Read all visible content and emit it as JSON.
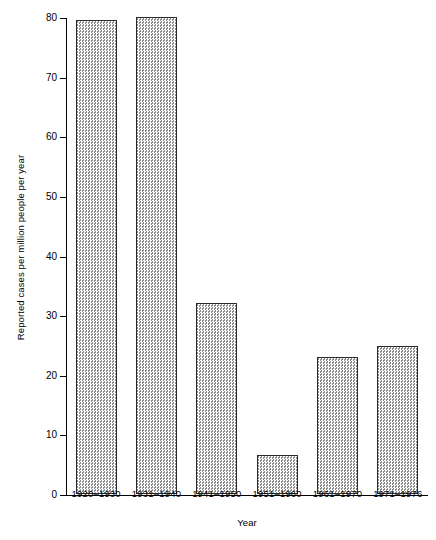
{
  "chart_data": {
    "type": "bar",
    "title": "",
    "xlabel": "Year",
    "ylabel": "Reported cases per million people per year",
    "categories": [
      "1920–1930",
      "1931–1940",
      "1941–1950",
      "1951–1960",
      "1961–1970",
      "1971–1976"
    ],
    "values": [
      79.5,
      80.0,
      32.0,
      6.5,
      23.0,
      24.8
    ],
    "ylim": [
      0,
      80
    ],
    "yticks": [
      0,
      10,
      20,
      30,
      40,
      50,
      60,
      70,
      80
    ],
    "ytick_labels": [
      "0",
      "10",
      "20",
      "30",
      "40",
      "50",
      "60",
      "70",
      "80"
    ],
    "grid": false,
    "legend": null,
    "bar_fill": "checkerboard-hatch",
    "bar_edge_color": "#2b2b2b"
  }
}
